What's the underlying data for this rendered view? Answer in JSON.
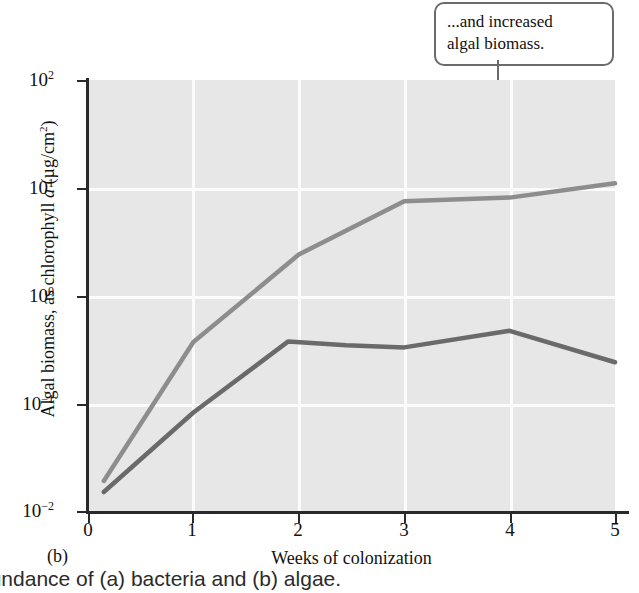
{
  "callout": {
    "line1": "...and increased",
    "line2": "algal biomass."
  },
  "panel": {
    "label": "(b)"
  },
  "figure_caption": "bundance of (a) bacteria and (b) algae.",
  "colors": {
    "plot_background": "#e7e7e7",
    "gridline": "#fbfbfb",
    "axis": "#2a2a2a",
    "algae_line": "#8d8d8d",
    "bacteria_line": "#6a6a6a",
    "callout_border": "#6b6b6b"
  },
  "axes": {
    "y_ticks": [
      {
        "mantissa": "10",
        "exponent": "2"
      },
      {
        "mantissa": "10",
        "exponent": "1"
      },
      {
        "mantissa": "10",
        "exponent": "0"
      },
      {
        "mantissa": "10",
        "exponent": "−1"
      },
      {
        "mantissa": "10",
        "exponent": "−2"
      }
    ],
    "x_ticks": [
      "0",
      "1",
      "2",
      "3",
      "4",
      "5"
    ],
    "y_title_pre": "Algal biomass, as chlorophyll ",
    "y_title_ital": "a",
    "y_title_post_open": " (µg/cm",
    "y_title_sup": "2",
    "y_title_post_close": ")",
    "x_title": "Weeks of colonization"
  },
  "chart_data": {
    "type": "line",
    "title": "",
    "xlabel": "Weeks of colonization",
    "ylabel": "Algal biomass, as chlorophyll a (µg/cm²)",
    "yscale": "log",
    "xlim": [
      0,
      5
    ],
    "ylim": [
      0.01,
      100
    ],
    "grid": true,
    "legend": "none",
    "annotations": [
      {
        "text": "...and increased algal biomass.",
        "points_to_x": 3.8,
        "points_to_y": 8.2
      }
    ],
    "series": [
      {
        "name": "upper curve",
        "color": "#8d8d8d",
        "x": [
          0.15,
          1.0,
          2.0,
          3.0,
          4.0,
          5.0
        ],
        "values": [
          0.019,
          0.37,
          2.4,
          7.5,
          8.1,
          11.0
        ]
      },
      {
        "name": "lower curve",
        "color": "#6a6a6a",
        "x": [
          0.15,
          1.0,
          1.9,
          2.45,
          3.0,
          4.0,
          5.0
        ],
        "values": [
          0.015,
          0.082,
          0.375,
          0.345,
          0.33,
          0.47,
          0.24
        ]
      }
    ]
  }
}
